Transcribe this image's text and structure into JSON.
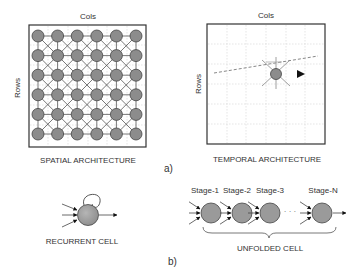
{
  "spatial": {
    "title": "SPATIAL ARCHITECTURE",
    "cols_label": "Cols",
    "rows_label": "Rows",
    "grid_size": [
      6,
      6
    ]
  },
  "temporal": {
    "title": "TEMPORAL ARCHITECTURE",
    "cols_label": "Cols",
    "rows_label": "Rows"
  },
  "part_a_label": "a)",
  "recurrent": {
    "title": "RECURRENT CELL"
  },
  "unfolded": {
    "title": "UNFOLDED CELL",
    "stages": [
      "Stage-1",
      "Stage-2",
      "Stage-3",
      "Stage-N"
    ],
    "ellipsis": "· · ·"
  },
  "part_b_label": "b)",
  "colors": {
    "node_fill": "#8c8c8c",
    "node_stroke": "#444444",
    "line": "#555555",
    "grid": "#d0d0d0"
  }
}
